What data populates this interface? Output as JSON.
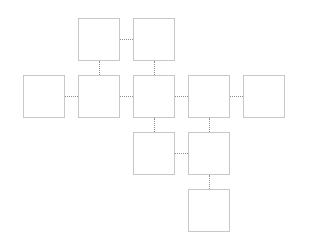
{
  "diagram": {
    "grid": {
      "col_x": [
        23,
        78,
        133,
        188,
        243
      ],
      "row_y": [
        18,
        75,
        132,
        189
      ],
      "box_w": 42,
      "box_h": 43
    },
    "colors": {
      "box_border": "#c8c8c8",
      "connector": "#8c8c8c",
      "background": "#ffffff"
    },
    "nodes": [
      {
        "id": "n1",
        "col": 1,
        "row": 0
      },
      {
        "id": "n2",
        "col": 2,
        "row": 0
      },
      {
        "id": "n3",
        "col": 0,
        "row": 1
      },
      {
        "id": "n4",
        "col": 1,
        "row": 1
      },
      {
        "id": "n5",
        "col": 2,
        "row": 1
      },
      {
        "id": "n6",
        "col": 3,
        "row": 1
      },
      {
        "id": "n7",
        "col": 4,
        "row": 1
      },
      {
        "id": "n8",
        "col": 2,
        "row": 2
      },
      {
        "id": "n9",
        "col": 3,
        "row": 2
      },
      {
        "id": "n10",
        "col": 3,
        "row": 3
      }
    ],
    "edges": [
      [
        "n1",
        "n2"
      ],
      [
        "n1",
        "n4"
      ],
      [
        "n2",
        "n5"
      ],
      [
        "n3",
        "n4"
      ],
      [
        "n4",
        "n5"
      ],
      [
        "n5",
        "n6"
      ],
      [
        "n6",
        "n7"
      ],
      [
        "n5",
        "n8"
      ],
      [
        "n6",
        "n9"
      ],
      [
        "n8",
        "n9"
      ],
      [
        "n9",
        "n10"
      ]
    ]
  }
}
